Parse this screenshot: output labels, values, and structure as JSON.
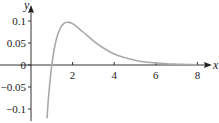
{
  "chart_data": {
    "type": "line",
    "title": "",
    "xlabel": "x",
    "ylabel": "y",
    "xlim": [
      0,
      8.6
    ],
    "ylim": [
      -0.125,
      0.12
    ],
    "x_ticks": [
      2,
      4,
      6,
      8
    ],
    "x_tick_labels": [
      "2",
      "4",
      "6",
      "8"
    ],
    "y_ticks": [
      0.1,
      0.05,
      0,
      -0.05,
      -0.1
    ],
    "y_tick_labels": [
      "0.1",
      "0.05",
      "0",
      "−0.05",
      "−0.1"
    ],
    "grid": false,
    "legend": null,
    "series": [
      {
        "name": "y = ln(x)·e^(−x)",
        "color": "#a9a9a9",
        "x": [
          0.77,
          0.85,
          1.0,
          1.2,
          1.4,
          1.6,
          1.76,
          2.0,
          2.5,
          3.0,
          3.5,
          4.0,
          4.5,
          5.0,
          5.5,
          6.0,
          6.5,
          7.0,
          7.5,
          8.0
        ],
        "y": [
          -0.121,
          -0.069,
          0.0,
          0.055,
          0.083,
          0.095,
          0.097,
          0.094,
          0.075,
          0.055,
          0.038,
          0.025,
          0.017,
          0.011,
          0.007,
          0.0044,
          0.0028,
          0.0018,
          0.0011,
          0.0007
        ]
      }
    ]
  }
}
